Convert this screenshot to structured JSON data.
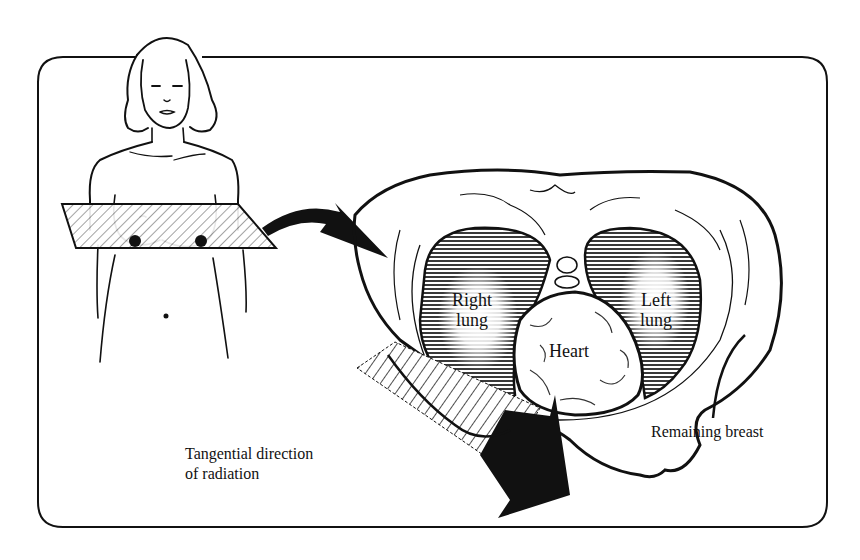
{
  "figure": {
    "panels": [
      {
        "id": "patient",
        "description": "Front view of female patient with hatched transverse plane through chest"
      },
      {
        "id": "cross-section",
        "description": "Transverse cross-section of thorax showing lungs, heart and remaining breast"
      }
    ]
  },
  "labels": {
    "right_lung": "Right\nlung",
    "left_lung": "Left\nlung",
    "heart": "Heart",
    "remaining_breast": "Remaining breast",
    "radiation_direction": "Tangential direction\nof radiation"
  },
  "colors": {
    "ink": "#111111",
    "background": "#ffffff",
    "lung_shading": "#2a2a2a"
  }
}
